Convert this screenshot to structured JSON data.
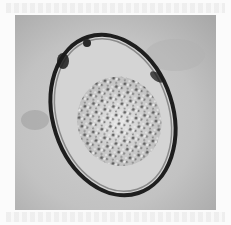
{
  "figure": {
    "type": "micrograph",
    "colors": {
      "background": "#c4c4c4",
      "shell": "#1e1e1e",
      "interior": "#d8d8d8",
      "granules": "#5a5a5a"
    }
  }
}
